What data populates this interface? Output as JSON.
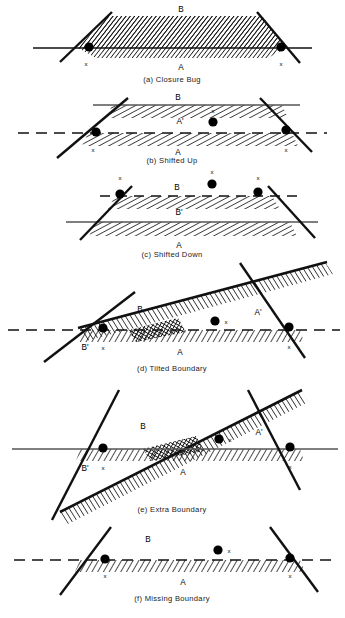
{
  "figure": {
    "title_caption": "",
    "bottom_caption": "",
    "marker_label": "x",
    "colors": {
      "ink": "#000000",
      "background": "#ffffff",
      "hatch": "#111111"
    }
  },
  "panels": [
    {
      "id": "a",
      "caption": "(a)  Closure Bug",
      "labels": {
        "upper": "B",
        "lower": "A",
        "upper_prime": "",
        "lower_prime": ""
      },
      "region_labels": [
        "B",
        "A"
      ],
      "markers": [
        "x",
        "x"
      ],
      "boundary_style": "solid",
      "dot_count": 2
    },
    {
      "id": "b",
      "caption": "(b)  Shifted Up",
      "labels": {
        "upper": "B",
        "middle": "A'",
        "lower": "A"
      },
      "region_labels": [
        "B",
        "A'",
        "A"
      ],
      "markers": [
        "x",
        "x",
        "x"
      ],
      "boundary_style": "dashed",
      "dot_count": 3
    },
    {
      "id": "c",
      "caption": "(c)  Shifted Down",
      "labels": {
        "upper": "B",
        "middle": "B'",
        "lower": "A"
      },
      "region_labels": [
        "B",
        "B'",
        "A"
      ],
      "markers": [
        "x",
        "x",
        "x"
      ],
      "boundary_style": "dashed",
      "dot_count": 3
    },
    {
      "id": "d",
      "caption": "(d) Tilted Boundary",
      "labels": {
        "upper": "B",
        "lower_left": "B'",
        "lower": "A",
        "right": "A'"
      },
      "region_labels": [
        "B",
        "B'",
        "A",
        "A'"
      ],
      "markers": [
        "x",
        "x",
        "x"
      ],
      "boundary_style": "dashed",
      "dot_count": 3
    },
    {
      "id": "e",
      "caption": "(e)  Extra Boundary",
      "labels": {
        "upper": "B",
        "lower_left": "B'",
        "lower": "A",
        "right": "A'"
      },
      "region_labels": [
        "B",
        "B'",
        "A",
        "A'"
      ],
      "markers": [
        "x",
        "x",
        "x"
      ],
      "boundary_style": "solid",
      "dot_count": 3
    },
    {
      "id": "f",
      "caption": "(f) Missing Boundary",
      "labels": {
        "upper": "B",
        "lower": "A"
      },
      "region_labels": [
        "B",
        "A"
      ],
      "markers": [
        "x",
        "x",
        "x"
      ],
      "boundary_style": "dashed",
      "dot_count": 3
    }
  ]
}
